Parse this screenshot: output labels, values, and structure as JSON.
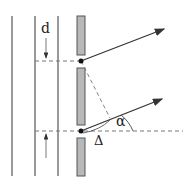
{
  "diagram": {
    "labels": {
      "spacing": "d",
      "angle": "α",
      "path_difference": "Δ"
    },
    "colors": {
      "line": "#555555",
      "bar_fill": "#b8b8b8",
      "bar_stroke": "#555555",
      "dash": "#777777",
      "arrow": "#333333",
      "dot": "#111111"
    }
  }
}
